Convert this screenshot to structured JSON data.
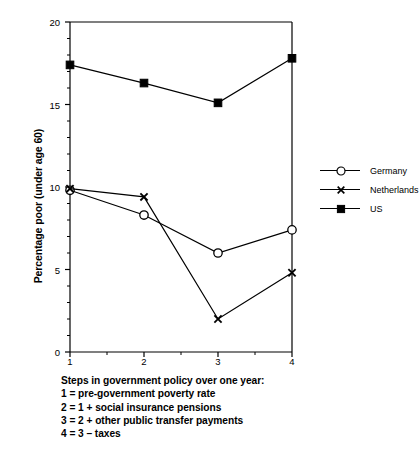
{
  "chart_data": {
    "type": "line",
    "title": "",
    "xlabel": "",
    "ylabel": "Percentage poor (under age 60)",
    "x": [
      1,
      2,
      3,
      4
    ],
    "categories": [
      "1",
      "2",
      "3",
      "4"
    ],
    "xlim": [
      1,
      4
    ],
    "ylim": [
      0,
      20
    ],
    "x_ticks": [
      1,
      2,
      3,
      4
    ],
    "x_tick_labels": [
      "1",
      "2",
      "3",
      "4"
    ],
    "x_minor_ticks": [
      1.5,
      2.5,
      3.5
    ],
    "y_ticks": [
      0,
      5,
      10,
      15,
      20
    ],
    "y_tick_labels": [
      "0",
      "5",
      "10",
      "15",
      "20"
    ],
    "y_minor_step": 1,
    "grid": false,
    "legend_position": "right",
    "series": [
      {
        "name": "Germany",
        "marker": "open-circle",
        "values": [
          9.8,
          8.3,
          6.0,
          7.4
        ]
      },
      {
        "name": "Netherlands",
        "marker": "x-cross",
        "values": [
          9.9,
          9.4,
          2.0,
          4.8
        ]
      },
      {
        "name": "US",
        "marker": "filled-square",
        "values": [
          17.4,
          16.3,
          15.1,
          17.8
        ]
      }
    ],
    "annotations": [
      "Steps in government policy over one year:",
      "1 = pre-government poverty rate",
      "2 = 1 + social insurance pensions",
      "3 = 2 + other public transfer payments",
      "4 = 3 – taxes"
    ]
  },
  "axis": {
    "y_label": "Percentage poor (under age 60)",
    "y_tick_0": "0",
    "y_tick_1": "5",
    "y_tick_2": "10",
    "y_tick_3": "15",
    "y_tick_4": "20",
    "x_tick_0": "1",
    "x_tick_1": "2",
    "x_tick_2": "3",
    "x_tick_3": "4"
  },
  "legend": {
    "item_0": "Germany",
    "item_1": "Netherlands",
    "item_2": "US"
  },
  "caption": {
    "line_0": "Steps in government policy over one year:",
    "line_1": "1 = pre-government poverty rate",
    "line_2": "2 = 1 + social insurance pensions",
    "line_3": "3 = 2 + other public transfer payments",
    "line_4": "4 = 3 – taxes"
  },
  "colors": {
    "line": "#000000",
    "background": "#ffffff",
    "marker_fill_open": "#ffffff",
    "marker_fill_solid": "#000000"
  }
}
